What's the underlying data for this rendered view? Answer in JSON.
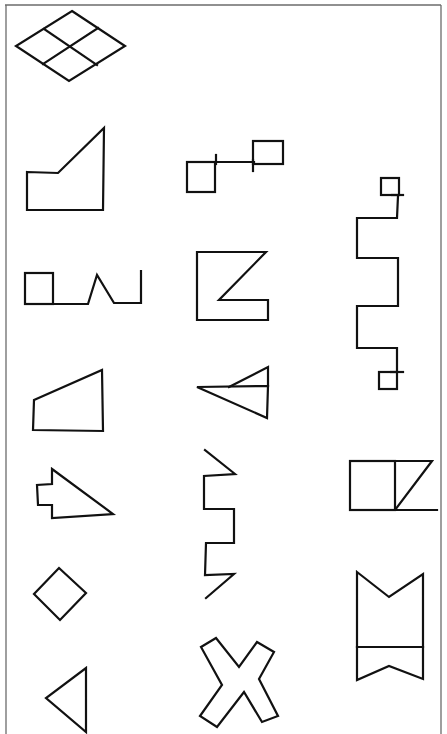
{
  "page": {
    "type": "worksheet",
    "background": "#ffffff",
    "ink_color": "#111111",
    "frame_color": "#6b6b6b"
  },
  "figures": [
    {
      "id": "rhombus-grid",
      "column": 1,
      "row": 0,
      "description": "rhombus divided into four smaller rhombi"
    },
    {
      "id": "pentagon-slant",
      "column": 1,
      "row": 1,
      "description": "pentagon with slanted top edge rising to the right"
    },
    {
      "id": "linked-squares",
      "column": 2,
      "row": 1,
      "description": "two small squares connected by a horizontal line, offset vertically"
    },
    {
      "id": "square-zigzag",
      "column": 1,
      "row": 2,
      "description": "square followed by baseline with a peak and a vertical end stroke"
    },
    {
      "id": "notched-square",
      "column": 2,
      "row": 2,
      "description": "square with a triangular notch cut from the right side"
    },
    {
      "id": "meander-squares",
      "column": 3,
      "row": 2,
      "description": "vertical square-wave meander with small squares at both ends"
    },
    {
      "id": "trapezoid",
      "column": 1,
      "row": 3,
      "description": "right trapezoid with slanted top edge"
    },
    {
      "id": "nested-triangles",
      "column": 2,
      "row": 3,
      "description": "left-pointing triangle with a smaller triangle inside on its upper half"
    },
    {
      "id": "arrow-tab",
      "column": 1,
      "row": 4,
      "description": "right-angled arrowhead with a rectangular tab on its left"
    },
    {
      "id": "meander-arrows",
      "column": 2,
      "row": 4,
      "description": "vertical meander with diagonal strokes at top and bottom"
    },
    {
      "id": "square-triangle",
      "column": 3,
      "row": 4,
      "description": "square joined to a right triangle with extended base line"
    },
    {
      "id": "diamond",
      "column": 1,
      "row": 5,
      "description": "square rotated 45 degrees"
    },
    {
      "id": "bowtie-banner",
      "column": 3,
      "row": 5,
      "description": "tall rectangle with V-notch at top, divider line and inverted V at bottom"
    },
    {
      "id": "triangle-left",
      "column": 1,
      "row": 6,
      "description": "left-pointing triangle"
    },
    {
      "id": "x-shape",
      "column": 2,
      "row": 6,
      "description": "outlined X shape"
    }
  ]
}
